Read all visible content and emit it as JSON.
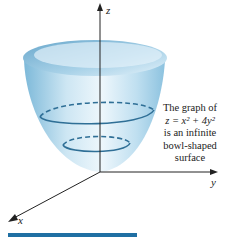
{
  "figure": {
    "axes": {
      "z_label": "z",
      "y_label": "y",
      "x_label": "x"
    },
    "caption": {
      "line1": "The graph of",
      "equation": "z = x² + 4y²",
      "line3": "is an infinite",
      "line4": "bowl-shaped",
      "line5": "surface"
    },
    "colors": {
      "surface_light": "#eef7fc",
      "surface_mid": "#bfdff0",
      "surface_dark": "#6fb1d4",
      "contour": "#2f6f96",
      "axis": "#222222",
      "bar": "#1f6fa3"
    }
  }
}
